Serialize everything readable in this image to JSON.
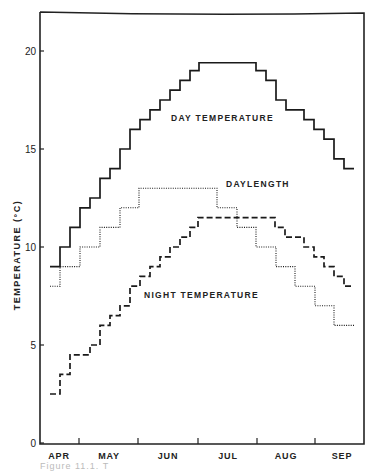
{
  "chart_data": {
    "type": "line",
    "subtype": "step",
    "title": "",
    "xlabel": "",
    "ylabel": "TEMPERATURE (°C)",
    "ylim": [
      0,
      21
    ],
    "yticks": [
      0,
      5,
      10,
      15,
      20
    ],
    "x_categories": [
      "APR",
      "MAY",
      "JUN",
      "JUL",
      "AUG",
      "SEP"
    ],
    "x_range_weeks": "early April to mid September, weekly steps",
    "grid": false,
    "series": [
      {
        "name": "DAY TEMPERATURE",
        "style": "solid",
        "label_pos": [
          171,
          121
        ],
        "steps": [
          [
            50,
            9.0
          ],
          [
            60,
            10.0
          ],
          [
            70,
            11.0
          ],
          [
            80,
            12.0
          ],
          [
            90,
            12.5
          ],
          [
            100,
            13.5
          ],
          [
            110,
            14.0
          ],
          [
            120,
            15.0
          ],
          [
            130,
            16.0
          ],
          [
            140,
            16.5
          ],
          [
            150,
            17.0
          ],
          [
            160,
            17.5
          ],
          [
            170,
            18.0
          ],
          [
            180,
            18.5
          ],
          [
            190,
            19.0
          ],
          [
            199,
            19.4
          ],
          [
            256,
            19.0
          ],
          [
            266,
            18.5
          ],
          [
            276,
            17.5
          ],
          [
            286,
            17.0
          ],
          [
            304,
            16.5
          ],
          [
            314,
            16.0
          ],
          [
            324,
            15.5
          ],
          [
            334,
            14.5
          ],
          [
            344,
            14.0
          ]
        ],
        "end_x": 354
      },
      {
        "name": "DAYLENGTH",
        "style": "dotted",
        "label_pos": [
          226,
          187
        ],
        "steps": [
          [
            50,
            8.0
          ],
          [
            60,
            9.0
          ],
          [
            80,
            10.0
          ],
          [
            100,
            11.0
          ],
          [
            120,
            12.0
          ],
          [
            139,
            13.0
          ],
          [
            217,
            12.0
          ],
          [
            237,
            11.0
          ],
          [
            256,
            10.0
          ],
          [
            276,
            9.0
          ],
          [
            295,
            8.0
          ],
          [
            315,
            7.0
          ],
          [
            334,
            6.0
          ]
        ],
        "end_x": 354
      },
      {
        "name": "NIGHT TEMPERATURE",
        "style": "dashed",
        "label_pos": [
          144,
          298
        ],
        "steps": [
          [
            50,
            2.5
          ],
          [
            60,
            3.5
          ],
          [
            70,
            4.5
          ],
          [
            90,
            5.0
          ],
          [
            100,
            6.0
          ],
          [
            110,
            6.5
          ],
          [
            120,
            7.0
          ],
          [
            130,
            8.0
          ],
          [
            140,
            8.5
          ],
          [
            150,
            9.0
          ],
          [
            160,
            9.5
          ],
          [
            170,
            10.0
          ],
          [
            180,
            10.5
          ],
          [
            190,
            11.0
          ],
          [
            198,
            11.5
          ],
          [
            275,
            11.0
          ],
          [
            285,
            10.5
          ],
          [
            304,
            10.0
          ],
          [
            314,
            9.5
          ],
          [
            324,
            9.0
          ],
          [
            334,
            8.5
          ],
          [
            344,
            8.0
          ]
        ],
        "end_x": 354
      }
    ]
  },
  "caption": "Figure 11.1. T"
}
